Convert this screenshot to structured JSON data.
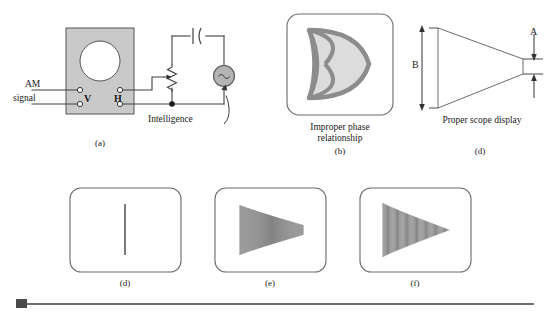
{
  "figure": {
    "title_hidden": "",
    "panels": [
      {
        "id": "a",
        "sublabel": "(a)",
        "caption": "",
        "kind": "circuit",
        "labels": {
          "input_line1": "AM",
          "input_line2": "signal",
          "vertical_terminal": "V",
          "horizontal_terminal": "H",
          "source_label": "Intelligence"
        },
        "components": [
          "scope-face",
          "crt-screen",
          "v-terminals",
          "h-terminals",
          "capacitor",
          "potentiometer",
          "ac-source",
          "junction-dot"
        ]
      },
      {
        "id": "b",
        "sublabel": "(b)",
        "caption": "Improper phase\nrelationship",
        "kind": "scope-display",
        "pattern": "phase-loop"
      },
      {
        "id": "c",
        "sublabel": "(c)",
        "caption": "Proper scope display",
        "kind": "trapezoid",
        "dimension_labels": {
          "large": "B",
          "small": "A"
        }
      },
      {
        "id": "d",
        "sublabel": "(d)",
        "caption": "",
        "kind": "scope-display",
        "pattern": "vertical-line",
        "modulation_percent": 0
      },
      {
        "id": "e",
        "sublabel": "(e)",
        "caption": "",
        "kind": "scope-display",
        "pattern": "trapezoid-partial",
        "modulation_percent": 80
      },
      {
        "id": "f",
        "sublabel": "(f)",
        "caption": "",
        "kind": "scope-display",
        "pattern": "triangle-full",
        "modulation_percent": 100
      }
    ]
  },
  "colors": {
    "line": "#404040",
    "panel_fill": "#c9c9c9",
    "screen_fill": "#ffffff",
    "source_fill": "#b4b4b4",
    "trace": "#5a5a5a",
    "shape_outline": "#8c8c8c",
    "shape_fill": "#dcdcdc",
    "rule": "#6d6d6d",
    "square": "#4a4a4a"
  }
}
